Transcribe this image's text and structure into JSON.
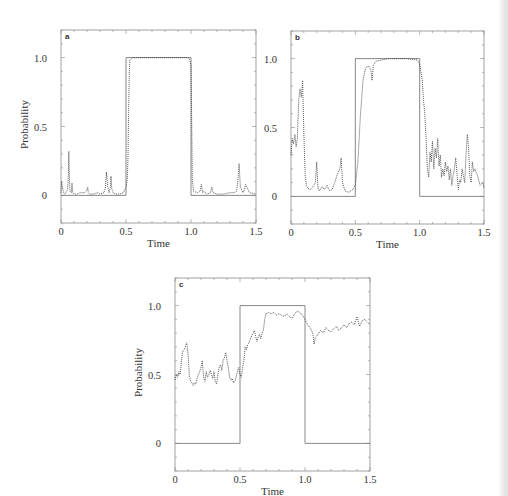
{
  "figure": {
    "panel_count": 3,
    "colors": {
      "frame": "#8a8a8a",
      "step_line": "#7a7a7a",
      "trace": "#444444",
      "background": "#ffffff"
    }
  },
  "chart_data": [
    {
      "type": "line",
      "panel_label": "a",
      "title": "",
      "xlabel": "Time",
      "ylabel": "Probability",
      "xlim": [
        0,
        1.5
      ],
      "ylim": [
        -0.2,
        1.2
      ],
      "xticks": [
        0,
        0.5,
        1.0,
        1.5
      ],
      "xtick_labels": [
        "0",
        "0.5",
        "1.0",
        "1.5"
      ],
      "yticks": [
        0,
        0.5,
        1.0
      ],
      "ytick_labels": [
        "0",
        "0.5",
        "1.0"
      ],
      "grid": false,
      "legend": null,
      "series": [
        {
          "name": "true state (step)",
          "style": "solid",
          "x": [
            0,
            0.5,
            0.5,
            1.0,
            1.0,
            1.5
          ],
          "y": [
            0,
            0,
            1,
            1,
            0,
            0
          ]
        },
        {
          "name": "estimated probability",
          "style": "dotted",
          "x": [
            0,
            0.005,
            0.01,
            0.02,
            0.03,
            0.04,
            0.05,
            0.055,
            0.06,
            0.065,
            0.07,
            0.08,
            0.085,
            0.09,
            0.1,
            0.12,
            0.15,
            0.18,
            0.2,
            0.205,
            0.21,
            0.22,
            0.25,
            0.28,
            0.3,
            0.33,
            0.34,
            0.35,
            0.36,
            0.37,
            0.38,
            0.385,
            0.39,
            0.4,
            0.42,
            0.45,
            0.48,
            0.49,
            0.5,
            0.51,
            0.515,
            0.52,
            0.525,
            0.53,
            0.55,
            0.6,
            0.7,
            0.8,
            0.9,
            0.98,
            0.99,
            1.0,
            1.005,
            1.01,
            1.02,
            1.05,
            1.07,
            1.08,
            1.09,
            1.1,
            1.12,
            1.15,
            1.16,
            1.17,
            1.2,
            1.25,
            1.3,
            1.33,
            1.35,
            1.36,
            1.37,
            1.38,
            1.4,
            1.41,
            1.42,
            1.45,
            1.5
          ],
          "y": [
            0.02,
            0.1,
            0.06,
            0.02,
            0.01,
            0.03,
            0.04,
            0.12,
            0.32,
            0.1,
            0.03,
            0.02,
            0.09,
            0.02,
            0.01,
            0.01,
            0.02,
            0.02,
            0.04,
            0.06,
            0.02,
            0.01,
            0.01,
            0.02,
            0.01,
            0.02,
            0.05,
            0.17,
            0.06,
            0.02,
            0.06,
            0.14,
            0.05,
            0.02,
            0.01,
            0.01,
            0.02,
            0.04,
            0.06,
            0.12,
            0.28,
            0.6,
            0.9,
            0.98,
            1.0,
            1.0,
            1.0,
            1.0,
            1.0,
            1.0,
            0.98,
            0.95,
            0.6,
            0.12,
            0.03,
            0.02,
            0.03,
            0.08,
            0.02,
            0.03,
            0.01,
            0.02,
            0.06,
            0.02,
            0.01,
            0.01,
            0.02,
            0.02,
            0.03,
            0.1,
            0.23,
            0.06,
            0.02,
            0.04,
            0.08,
            0.02,
            0.01
          ]
        }
      ]
    },
    {
      "type": "line",
      "panel_label": "b",
      "title": "",
      "xlabel": "Time",
      "ylabel": "",
      "xlim": [
        0,
        1.5
      ],
      "ylim": [
        -0.2,
        1.2
      ],
      "xticks": [
        0,
        0.5,
        1.0,
        1.5
      ],
      "xtick_labels": [
        "0",
        "0.5",
        "1.0",
        "1.5"
      ],
      "yticks": [
        0,
        0.5,
        1.0
      ],
      "ytick_labels": [
        "0",
        "0.5",
        "1.0"
      ],
      "grid": false,
      "legend": null,
      "series": [
        {
          "name": "true state (step)",
          "style": "solid",
          "x": [
            0,
            0.5,
            0.5,
            1.0,
            1.0,
            1.5
          ],
          "y": [
            0,
            0,
            1,
            1,
            0,
            0
          ]
        },
        {
          "name": "estimated probability",
          "style": "dotted",
          "x": [
            0,
            0.01,
            0.02,
            0.03,
            0.04,
            0.05,
            0.06,
            0.07,
            0.08,
            0.09,
            0.1,
            0.11,
            0.12,
            0.13,
            0.15,
            0.17,
            0.19,
            0.2,
            0.21,
            0.22,
            0.24,
            0.26,
            0.28,
            0.3,
            0.32,
            0.34,
            0.36,
            0.38,
            0.39,
            0.4,
            0.42,
            0.45,
            0.48,
            0.5,
            0.52,
            0.54,
            0.55,
            0.56,
            0.58,
            0.6,
            0.62,
            0.63,
            0.64,
            0.66,
            0.7,
            0.75,
            0.8,
            0.9,
            0.98,
            1.0,
            1.02,
            1.03,
            1.04,
            1.05,
            1.06,
            1.07,
            1.08,
            1.09,
            1.1,
            1.11,
            1.12,
            1.13,
            1.14,
            1.15,
            1.16,
            1.17,
            1.18,
            1.19,
            1.2,
            1.21,
            1.22,
            1.23,
            1.24,
            1.25,
            1.26,
            1.27,
            1.28,
            1.3,
            1.31,
            1.32,
            1.33,
            1.34,
            1.35,
            1.36,
            1.37,
            1.38,
            1.39,
            1.4,
            1.41,
            1.42,
            1.43,
            1.45,
            1.47,
            1.49,
            1.5
          ],
          "y": [
            0.3,
            0.42,
            0.38,
            0.45,
            0.36,
            0.42,
            0.7,
            0.78,
            0.72,
            0.84,
            0.45,
            0.15,
            0.08,
            0.06,
            0.05,
            0.07,
            0.1,
            0.25,
            0.06,
            0.04,
            0.07,
            0.05,
            0.08,
            0.04,
            0.05,
            0.1,
            0.16,
            0.2,
            0.28,
            0.1,
            0.04,
            0.03,
            0.05,
            0.08,
            0.25,
            0.6,
            0.72,
            0.85,
            0.93,
            0.95,
            0.92,
            0.84,
            0.95,
            0.98,
            0.99,
            1.0,
            1.0,
            1.0,
            0.99,
            0.96,
            0.85,
            0.7,
            0.6,
            0.42,
            0.2,
            0.14,
            0.32,
            0.25,
            0.4,
            0.2,
            0.35,
            0.28,
            0.42,
            0.22,
            0.3,
            0.14,
            0.2,
            0.15,
            0.25,
            0.18,
            0.22,
            0.12,
            0.2,
            0.08,
            0.15,
            0.2,
            0.28,
            0.05,
            0.12,
            0.1,
            0.2,
            0.15,
            0.1,
            0.3,
            0.45,
            0.35,
            0.15,
            0.1,
            0.25,
            0.18,
            0.2,
            0.15,
            0.08,
            0.1,
            0.06
          ]
        }
      ]
    },
    {
      "type": "line",
      "panel_label": "c",
      "title": "",
      "xlabel": "Time",
      "ylabel": "Probability",
      "xlim": [
        0,
        1.5
      ],
      "ylim": [
        -0.2,
        1.2
      ],
      "xticks": [
        0,
        0.5,
        1.0,
        1.5
      ],
      "xtick_labels": [
        "0",
        "0.5",
        "1.0",
        "1.5"
      ],
      "yticks": [
        0,
        0.5,
        1.0
      ],
      "ytick_labels": [
        "0",
        "0.5",
        "1.0"
      ],
      "grid": false,
      "legend": null,
      "series": [
        {
          "name": "true state (step)",
          "style": "solid",
          "x": [
            0,
            0.5,
            0.5,
            1.0,
            1.0,
            1.5
          ],
          "y": [
            0,
            0,
            1,
            1,
            0,
            0
          ]
        },
        {
          "name": "estimated probability",
          "style": "dotted",
          "x": [
            0,
            0.01,
            0.02,
            0.03,
            0.04,
            0.05,
            0.06,
            0.07,
            0.08,
            0.09,
            0.1,
            0.11,
            0.12,
            0.13,
            0.14,
            0.15,
            0.16,
            0.17,
            0.18,
            0.19,
            0.2,
            0.21,
            0.22,
            0.23,
            0.24,
            0.25,
            0.26,
            0.27,
            0.28,
            0.29,
            0.3,
            0.31,
            0.32,
            0.33,
            0.34,
            0.35,
            0.36,
            0.37,
            0.38,
            0.39,
            0.4,
            0.41,
            0.42,
            0.43,
            0.44,
            0.45,
            0.46,
            0.47,
            0.48,
            0.49,
            0.5,
            0.51,
            0.52,
            0.53,
            0.54,
            0.55,
            0.56,
            0.57,
            0.58,
            0.59,
            0.6,
            0.61,
            0.62,
            0.63,
            0.64,
            0.65,
            0.66,
            0.67,
            0.68,
            0.69,
            0.7,
            0.72,
            0.74,
            0.76,
            0.78,
            0.8,
            0.82,
            0.84,
            0.86,
            0.88,
            0.9,
            0.92,
            0.94,
            0.96,
            0.98,
            1.0,
            1.02,
            1.04,
            1.06,
            1.07,
            1.08,
            1.1,
            1.12,
            1.14,
            1.16,
            1.18,
            1.2,
            1.22,
            1.24,
            1.26,
            1.28,
            1.3,
            1.32,
            1.34,
            1.36,
            1.38,
            1.4,
            1.42,
            1.44,
            1.46,
            1.48,
            1.5
          ],
          "y": [
            0.46,
            0.5,
            0.48,
            0.52,
            0.5,
            0.6,
            0.67,
            0.68,
            0.7,
            0.73,
            0.65,
            0.5,
            0.45,
            0.44,
            0.42,
            0.44,
            0.43,
            0.47,
            0.5,
            0.52,
            0.55,
            0.6,
            0.48,
            0.45,
            0.52,
            0.48,
            0.5,
            0.53,
            0.5,
            0.47,
            0.52,
            0.45,
            0.43,
            0.5,
            0.55,
            0.57,
            0.53,
            0.6,
            0.62,
            0.66,
            0.6,
            0.55,
            0.48,
            0.46,
            0.47,
            0.44,
            0.45,
            0.48,
            0.52,
            0.55,
            0.5,
            0.48,
            0.55,
            0.6,
            0.7,
            0.68,
            0.72,
            0.73,
            0.76,
            0.78,
            0.8,
            0.82,
            0.78,
            0.74,
            0.77,
            0.79,
            0.76,
            0.8,
            0.82,
            0.9,
            0.94,
            0.95,
            0.94,
            0.95,
            0.93,
            0.94,
            0.93,
            0.92,
            0.94,
            0.92,
            0.91,
            0.94,
            0.96,
            0.95,
            0.93,
            0.9,
            0.86,
            0.84,
            0.8,
            0.72,
            0.77,
            0.79,
            0.82,
            0.8,
            0.84,
            0.82,
            0.81,
            0.83,
            0.85,
            0.82,
            0.84,
            0.86,
            0.84,
            0.87,
            0.88,
            0.86,
            0.92,
            0.85,
            0.89,
            0.9,
            0.88,
            0.86
          ]
        }
      ]
    }
  ],
  "layout": {
    "panels": [
      {
        "left": 61,
        "right": 256,
        "top": 30,
        "bottom": 223
      },
      {
        "left": 291,
        "right": 484,
        "top": 31,
        "bottom": 224
      },
      {
        "left": 175,
        "right": 370,
        "top": 278,
        "bottom": 471
      }
    ]
  }
}
